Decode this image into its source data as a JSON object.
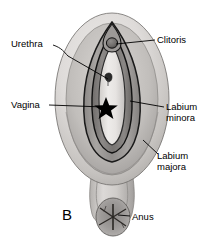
{
  "figure": {
    "panel_letter": "B",
    "description_type": "anatomical-illustration",
    "colors": {
      "line": "#000000",
      "text": "#000000",
      "background": "#ffffff",
      "skin_light": "#e3e1df",
      "skin_mid": "#b9b6b3",
      "skin_dark": "#8d8a88",
      "fold_shadow": "#6d6a68",
      "marker": "#000000"
    }
  },
  "labels": {
    "urethra": "Urethra",
    "clitoris": "Clitoris",
    "vagina": "Vagina",
    "labium_minora_line1": "Labium",
    "labium_minora_line2": "minora",
    "labium_majora_line1": "Labium",
    "labium_majora_line2": "majora",
    "anus": "Anus"
  },
  "markers": {
    "vaginal_opening": "star-marker"
  },
  "icons": {
    "star": "five-pointed-star"
  }
}
